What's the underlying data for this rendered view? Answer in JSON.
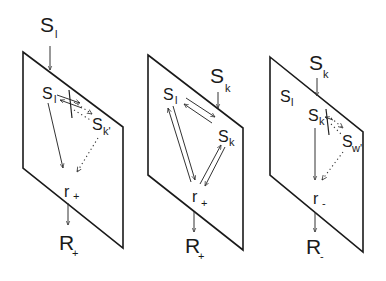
{
  "panels": [
    {
      "id": "left",
      "input": {
        "main": "S",
        "sub": "l"
      },
      "nodes": {
        "a": {
          "main": "S",
          "sub": "l"
        },
        "b": {
          "main": "S",
          "sub": "k'"
        },
        "r": {
          "main": "r",
          "sub": "+"
        }
      },
      "output": {
        "main": "R",
        "sub": "+"
      }
    },
    {
      "id": "middle",
      "input": {
        "main": "S",
        "sub": "k"
      },
      "nodes": {
        "a": {
          "main": "S",
          "sub": "l"
        },
        "b": {
          "main": "S",
          "sub": "k"
        },
        "r": {
          "main": "r",
          "sub": "+"
        }
      },
      "output": {
        "main": "R",
        "sub": "+"
      }
    },
    {
      "id": "right",
      "input": {
        "main": "S",
        "sub": "k"
      },
      "nodes": {
        "c": {
          "main": "S",
          "sub": "l"
        },
        "a": {
          "main": "S",
          "sub": "k"
        },
        "b": {
          "main": "S",
          "sub": "w'"
        },
        "r": {
          "main": "r",
          "sub": "-"
        }
      },
      "output": {
        "main": "R",
        "sub": "-"
      }
    }
  ]
}
